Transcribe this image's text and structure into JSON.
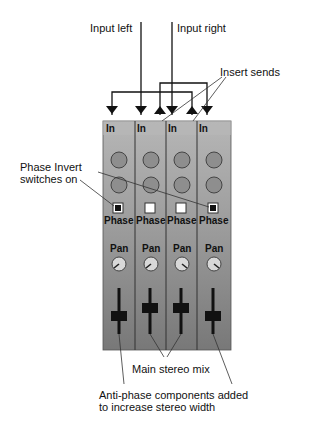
{
  "diagram": {
    "labels": {
      "input_left": "Input left",
      "input_right": "Input right",
      "insert_sends": "Insert sends",
      "phase_invert_line1": "Phase Invert",
      "phase_invert_line2": "switches on",
      "main_stereo_mix": "Main stereo mix",
      "anti_phase_line1": "Anti-phase components added",
      "anti_phase_line2": "to increase stereo width"
    },
    "channels": [
      {
        "in_label": "In",
        "phase_label": "Phase",
        "pan_label": "Pan",
        "phase_on": true,
        "pan_direction": "left",
        "fader_position": "low"
      },
      {
        "in_label": "In",
        "phase_label": "Phase",
        "pan_label": "Pan",
        "phase_on": false,
        "pan_direction": "left",
        "fader_position": "high"
      },
      {
        "in_label": "In",
        "phase_label": "Phase",
        "pan_label": "Pan",
        "phase_on": false,
        "pan_direction": "right",
        "fader_position": "high"
      },
      {
        "in_label": "In",
        "phase_label": "Phase",
        "pan_label": "Pan",
        "phase_on": true,
        "pan_direction": "right",
        "fader_position": "low"
      }
    ],
    "colors": {
      "panel_top": "#b4b4b4",
      "panel_bottom": "#7a7a7a",
      "knob_fill": "#8e8e8e",
      "pan_knob_fill": "#d8d8d8",
      "line": "#111111"
    }
  }
}
